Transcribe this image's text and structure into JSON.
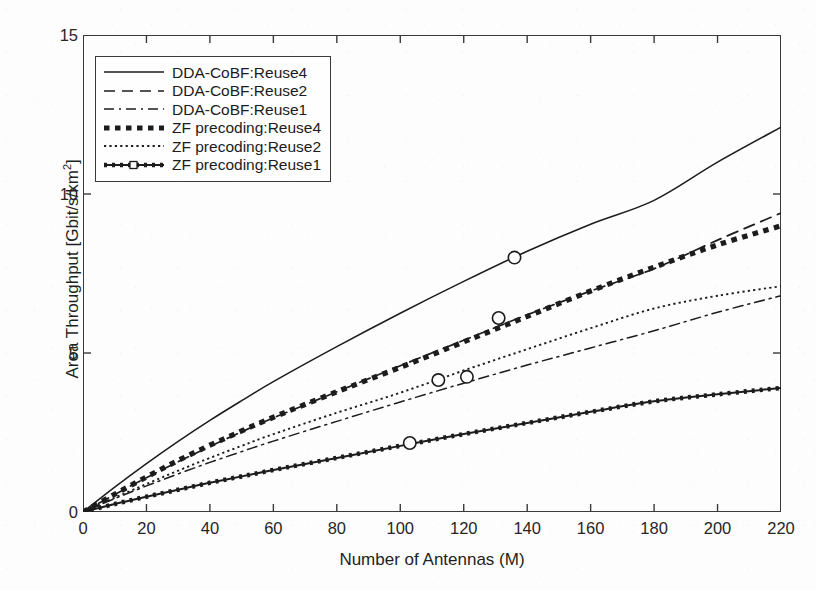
{
  "chart_data": {
    "type": "line",
    "title": "",
    "xlabel": "Number of Antennas (M)",
    "ylabel": "Area Throughput [Gbit/s/km²]",
    "xlim": [
      0,
      220
    ],
    "ylim": [
      0,
      15
    ],
    "xticks": [
      0,
      20,
      40,
      60,
      80,
      100,
      120,
      140,
      160,
      180,
      200,
      220
    ],
    "yticks": [
      0,
      5,
      10,
      15
    ],
    "grid": false,
    "legend_position": "upper left",
    "x": [
      0,
      10,
      20,
      30,
      40,
      50,
      60,
      80,
      100,
      120,
      140,
      160,
      180,
      200,
      220
    ],
    "series": [
      {
        "name": "DDA-CoBF:Reuse4",
        "style": "solid",
        "marker": "circle",
        "marker_points": [
          {
            "x": 136,
            "y": 8.0
          }
        ],
        "values": [
          0,
          0.78,
          1.52,
          2.22,
          2.88,
          3.5,
          4.1,
          5.2,
          6.25,
          7.25,
          8.2,
          9.05,
          9.8,
          11.0,
          12.1
        ]
      },
      {
        "name": "DDA-CoBF:Reuse2",
        "style": "dashed",
        "marker": "none",
        "marker_points": [],
        "values": [
          0,
          0.55,
          1.08,
          1.58,
          2.06,
          2.52,
          2.96,
          3.78,
          4.6,
          5.4,
          6.2,
          6.95,
          7.65,
          8.55,
          9.4
        ]
      },
      {
        "name": "DDA-CoBF:Reuse1",
        "style": "dashdot",
        "marker": "circle",
        "marker_points": [
          {
            "x": 121,
            "y": 4.25
          }
        ],
        "values": [
          0,
          0.42,
          0.82,
          1.2,
          1.56,
          1.9,
          2.23,
          2.85,
          3.46,
          4.05,
          4.62,
          5.16,
          5.7,
          6.28,
          6.8
        ]
      },
      {
        "name": "ZF precoding:Reuse4",
        "style": "thick-dotted",
        "marker": "circle",
        "marker_points": [
          {
            "x": 131,
            "y": 6.1
          }
        ],
        "values": [
          0,
          0.56,
          1.1,
          1.62,
          2.1,
          2.55,
          2.98,
          3.78,
          4.55,
          5.35,
          6.15,
          6.95,
          7.7,
          8.4,
          9.0
        ]
      },
      {
        "name": "ZF precoding:Reuse2",
        "style": "dotted",
        "marker": "circle",
        "marker_points": [
          {
            "x": 112,
            "y": 4.15
          }
        ],
        "values": [
          0,
          0.45,
          0.88,
          1.3,
          1.7,
          2.08,
          2.45,
          3.12,
          3.75,
          4.45,
          5.12,
          5.78,
          6.4,
          6.8,
          7.1
        ]
      },
      {
        "name": "ZF precoding:Reuse1",
        "style": "solid-square",
        "marker": "circle",
        "marker_points": [
          {
            "x": 103,
            "y": 2.17
          }
        ],
        "values": [
          0,
          0.25,
          0.48,
          0.7,
          0.92,
          1.12,
          1.32,
          1.7,
          2.08,
          2.45,
          2.8,
          3.15,
          3.48,
          3.7,
          3.9
        ]
      }
    ]
  },
  "colors": {
    "axis": "#3a3a3a",
    "line": "#1c1c1c",
    "background": "#fdfdfd",
    "text": "#1f1f1f"
  }
}
